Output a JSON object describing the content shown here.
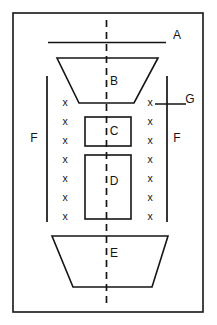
{
  "figure": {
    "type": "line-diagram",
    "background_color": "#ffffff",
    "stroke_color": "#151515",
    "canvas": {
      "width": 217,
      "height": 325
    },
    "border": {
      "name": "outer-frame",
      "x": 13,
      "y": 13,
      "width": 190,
      "height": 299,
      "stroke_width": 1.6
    },
    "centerline": {
      "name": "axis-of-symmetry",
      "x": 106.5,
      "y_top": 20,
      "y_bottom": 308,
      "style": "dashed",
      "dash": "7 5",
      "stroke_width": 1.7
    },
    "labels": [
      {
        "id": "A",
        "text": "A",
        "x": 177,
        "y": 36,
        "refers_to": "horizontal-line"
      },
      {
        "id": "B",
        "text": "B",
        "x": 114,
        "y": 82,
        "refers_to": "upper-trapezoid"
      },
      {
        "id": "C",
        "text": "C",
        "x": 114,
        "y": 132,
        "refers_to": "upper-rectangle"
      },
      {
        "id": "D",
        "text": "D",
        "x": 114,
        "y": 182,
        "refers_to": "lower-rectangle"
      },
      {
        "id": "E",
        "text": "E",
        "x": 114,
        "y": 254,
        "refers_to": "lower-trapezoid"
      },
      {
        "id": "F-left",
        "text": "F",
        "x": 34,
        "y": 139,
        "refers_to": "left-dimension-line"
      },
      {
        "id": "F-right",
        "text": "F",
        "x": 177,
        "y": 139,
        "refers_to": "right-dimension-line"
      },
      {
        "id": "G",
        "text": "G",
        "x": 190,
        "y": 100,
        "refers_to": "g-leader-line"
      }
    ],
    "shapes": {
      "line_a": {
        "name": "horizontal-line-a",
        "x1": 48,
        "y1": 42.5,
        "x2": 166,
        "y2": 42.5,
        "stroke_width": 1.6
      },
      "trapezoid_b": {
        "name": "upper-trapezoid-b",
        "points": "57,58 158,58 134,103 79,103",
        "stroke_width": 1.6
      },
      "rectangle_c": {
        "name": "upper-rectangle-c",
        "x": 85,
        "y": 117,
        "width": 46,
        "height": 29,
        "stroke_width": 1.6
      },
      "rectangle_d": {
        "name": "lower-rectangle-d",
        "x": 85,
        "y": 155,
        "width": 46,
        "height": 64,
        "stroke_width": 1.6
      },
      "trapezoid_e": {
        "name": "lower-trapezoid-e",
        "points": "52,236 168,236 152,287 73,287",
        "stroke_width": 1.6
      },
      "dimension_line_left": {
        "name": "left-dimension-line-f",
        "x": 47,
        "y_top": 76,
        "y_bottom": 222,
        "stroke_width": 1.7
      },
      "dimension_line_right": {
        "name": "right-dimension-line-f",
        "x": 167,
        "y_top": 76,
        "y_bottom": 222,
        "stroke_width": 1.7
      },
      "leader_g": {
        "name": "g-leader-line",
        "x1": 155,
        "y1": 104,
        "x2": 186,
        "y2": 104,
        "stroke_width": 1.5
      }
    },
    "x_marks": {
      "name": "x-mark-columns",
      "glyph": "x",
      "count_per_column": 7,
      "left_column_x": 65,
      "right_column_x": 150,
      "rows_y": [
        103,
        122,
        141,
        160,
        179,
        198,
        217
      ]
    }
  }
}
